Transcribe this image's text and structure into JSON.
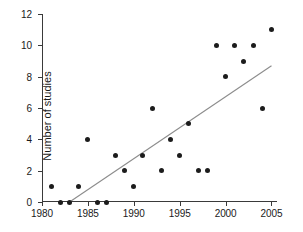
{
  "chart_data": {
    "type": "scatter",
    "title": "",
    "xlabel": "",
    "ylabel": "Number of studies",
    "xlim": [
      1980,
      2005.6
    ],
    "ylim": [
      0,
      12
    ],
    "grid": false,
    "legend": "none",
    "xticks": [
      1980,
      1985,
      1990,
      1995,
      2000,
      2005
    ],
    "xtick_labels": [
      "1980",
      "1985",
      "1990",
      "1995",
      "2000",
      "2005"
    ],
    "yticks": [
      0,
      2,
      4,
      6,
      8,
      10,
      12
    ],
    "ytick_labels": [
      "0",
      "2",
      "4",
      "6",
      "8",
      "10",
      "12"
    ],
    "x": [
      1981,
      1982,
      1983,
      1984,
      1985,
      1986,
      1987,
      1988,
      1989,
      1990,
      1991,
      1992,
      1993,
      1994,
      1995,
      1996,
      1997,
      1998,
      1999,
      2000,
      2001,
      2002,
      2003,
      2004,
      2005
    ],
    "values": [
      1,
      0,
      0,
      1,
      4,
      0,
      0,
      3,
      2,
      1,
      3,
      6,
      2,
      4,
      3,
      5,
      2,
      2,
      10,
      8,
      10,
      9,
      10,
      6,
      11
    ],
    "points": [
      {
        "x": 1981,
        "y": 1
      },
      {
        "x": 1982,
        "y": 0
      },
      {
        "x": 1983,
        "y": 0
      },
      {
        "x": 1984,
        "y": 1
      },
      {
        "x": 1985,
        "y": 4
      },
      {
        "x": 1986,
        "y": 0
      },
      {
        "x": 1987,
        "y": 0
      },
      {
        "x": 1988,
        "y": 3
      },
      {
        "x": 1989,
        "y": 2
      },
      {
        "x": 1990,
        "y": 1
      },
      {
        "x": 1991,
        "y": 3
      },
      {
        "x": 1992,
        "y": 6
      },
      {
        "x": 1993,
        "y": 2
      },
      {
        "x": 1994,
        "y": 4
      },
      {
        "x": 1995,
        "y": 3
      },
      {
        "x": 1996,
        "y": 5
      },
      {
        "x": 1997,
        "y": 2
      },
      {
        "x": 1998,
        "y": 2
      },
      {
        "x": 1999,
        "y": 10
      },
      {
        "x": 2000,
        "y": 8
      },
      {
        "x": 2001,
        "y": 10
      },
      {
        "x": 2002,
        "y": 9
      },
      {
        "x": 2003,
        "y": 10
      },
      {
        "x": 2004,
        "y": 6
      },
      {
        "x": 2005,
        "y": 11
      }
    ],
    "trend_line": {
      "x_start": 1983,
      "y_start": 0,
      "x_end": 2005,
      "y_end": 8.7,
      "color": "#8c8c8c"
    },
    "marker_color": "#1c1c1c",
    "axis_color": "#3a3a3a"
  }
}
